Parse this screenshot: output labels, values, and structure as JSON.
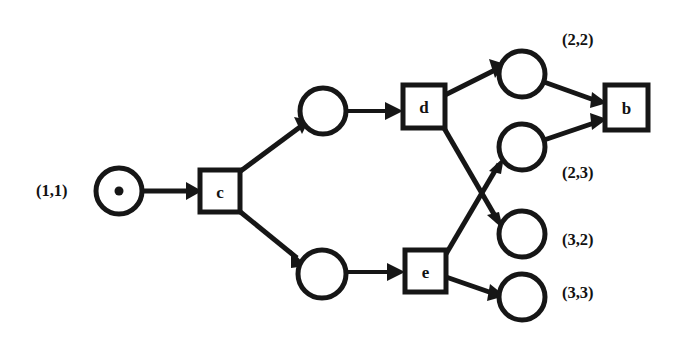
{
  "diagram": {
    "kind": "petri-net",
    "background_color": "#ffffff",
    "ink_color": "#161616",
    "places": [
      {
        "id": "p-start",
        "label": "(1,1)",
        "label_x": 36,
        "label_y": 190,
        "cx": 119,
        "cy": 191,
        "r": 23,
        "tokens": 1,
        "token_r": 4.5
      },
      {
        "id": "p-upper-mid",
        "label": "",
        "label_x": 0,
        "label_y": 0,
        "cx": 323,
        "cy": 111,
        "r": 23,
        "tokens": 0,
        "token_r": 0
      },
      {
        "id": "p-lower-mid",
        "label": "",
        "label_x": 0,
        "label_y": 0,
        "cx": 322,
        "cy": 274,
        "r": 24,
        "tokens": 0,
        "token_r": 0
      },
      {
        "id": "p-2-2",
        "label": "(2,2)",
        "label_x": 562,
        "label_y": 39,
        "cx": 522,
        "cy": 74,
        "r": 23,
        "tokens": 0,
        "token_r": 0
      },
      {
        "id": "p-2-3",
        "label": "(2,3)",
        "label_x": 562,
        "label_y": 172,
        "cx": 522,
        "cy": 147,
        "r": 23,
        "tokens": 0,
        "token_r": 0
      },
      {
        "id": "p-3-2",
        "label": "(3,2)",
        "label_x": 562,
        "label_y": 239,
        "cx": 522,
        "cy": 234,
        "r": 23,
        "tokens": 0,
        "token_r": 0
      },
      {
        "id": "p-3-3",
        "label": "(3,3)",
        "label_x": 562,
        "label_y": 292,
        "cx": 522,
        "cy": 297,
        "r": 23,
        "tokens": 0,
        "token_r": 0
      }
    ],
    "transitions": [
      {
        "id": "t-c",
        "label": "c",
        "x": 200,
        "y": 170,
        "w": 40,
        "h": 42
      },
      {
        "id": "t-d",
        "label": "d",
        "x": 403,
        "y": 85,
        "w": 42,
        "h": 43
      },
      {
        "id": "t-e",
        "label": "e",
        "x": 405,
        "y": 250,
        "w": 41,
        "h": 42
      },
      {
        "id": "t-b",
        "label": "b",
        "x": 605,
        "y": 85,
        "w": 43,
        "h": 45
      }
    ],
    "arcs": [
      {
        "id": "arc-start-c",
        "from": "p-start",
        "to": "t-c"
      },
      {
        "id": "arc-c-upper",
        "from": "t-c",
        "to": "p-upper-mid"
      },
      {
        "id": "arc-c-lower",
        "from": "t-c",
        "to": "p-lower-mid"
      },
      {
        "id": "arc-upper-d",
        "from": "p-upper-mid",
        "to": "t-d"
      },
      {
        "id": "arc-lower-e",
        "from": "p-lower-mid",
        "to": "t-e"
      },
      {
        "id": "arc-d-22",
        "from": "t-d",
        "to": "p-2-2"
      },
      {
        "id": "arc-d-32",
        "from": "t-d",
        "to": "p-3-2"
      },
      {
        "id": "arc-e-23",
        "from": "t-e",
        "to": "p-2-3"
      },
      {
        "id": "arc-e-33",
        "from": "t-e",
        "to": "p-3-3"
      },
      {
        "id": "arc-22-b",
        "from": "p-2-2",
        "to": "t-b"
      },
      {
        "id": "arc-23-b",
        "from": "p-2-3",
        "to": "t-b"
      }
    ]
  }
}
